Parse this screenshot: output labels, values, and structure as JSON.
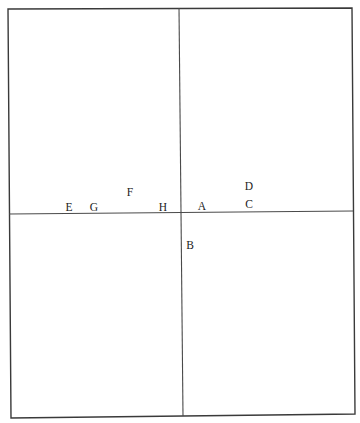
{
  "diagram": {
    "frame": {
      "top_left": [
        8,
        9
      ],
      "top_right": [
        352,
        8
      ],
      "bottom_right": [
        355,
        414
      ],
      "bottom_left": [
        11,
        418
      ]
    },
    "axes": {
      "vertical": {
        "x1": 179,
        "y1": 8,
        "x2": 183,
        "y2": 416
      },
      "horizontal": {
        "x1": 9,
        "y1": 214,
        "x2": 353,
        "y2": 211
      }
    },
    "colors": {
      "line": "#3a3a3a",
      "text": "#222222",
      "background": "#ffffff"
    },
    "labels": [
      {
        "id": "A",
        "text": "A",
        "x": 202,
        "y": 210
      },
      {
        "id": "B",
        "text": "B",
        "x": 190,
        "y": 249
      },
      {
        "id": "C",
        "text": "C",
        "x": 249,
        "y": 208
      },
      {
        "id": "D",
        "text": "D",
        "x": 249,
        "y": 190
      },
      {
        "id": "E",
        "text": "E",
        "x": 69,
        "y": 211
      },
      {
        "id": "F",
        "text": "F",
        "x": 130,
        "y": 196
      },
      {
        "id": "G",
        "text": "G",
        "x": 94,
        "y": 211
      },
      {
        "id": "H",
        "text": "H",
        "x": 163,
        "y": 211
      }
    ]
  }
}
